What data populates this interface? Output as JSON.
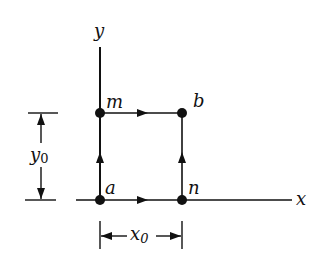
{
  "diagram": {
    "axes": {
      "x_label": "x",
      "y_label": "y"
    },
    "points": [
      {
        "name": "a",
        "label": "a",
        "x": 100,
        "y": 200
      },
      {
        "name": "m",
        "label": "m",
        "x": 100,
        "y": 113
      },
      {
        "name": "b",
        "label": "b",
        "x": 182,
        "y": 113
      },
      {
        "name": "n",
        "label": "n",
        "x": 182,
        "y": 200
      }
    ],
    "paths": [
      {
        "from": "a",
        "to": "m",
        "direction": "up"
      },
      {
        "from": "m",
        "to": "b",
        "direction": "right"
      },
      {
        "from": "a",
        "to": "n",
        "direction": "right"
      },
      {
        "from": "n",
        "to": "b",
        "direction": "up"
      }
    ],
    "dimensions": {
      "y0": {
        "label": "y",
        "subscript": "0"
      },
      "x0": {
        "label": "x",
        "subscript": "0"
      }
    },
    "colors": {
      "ink": "#111111",
      "background": "#ffffff"
    }
  }
}
